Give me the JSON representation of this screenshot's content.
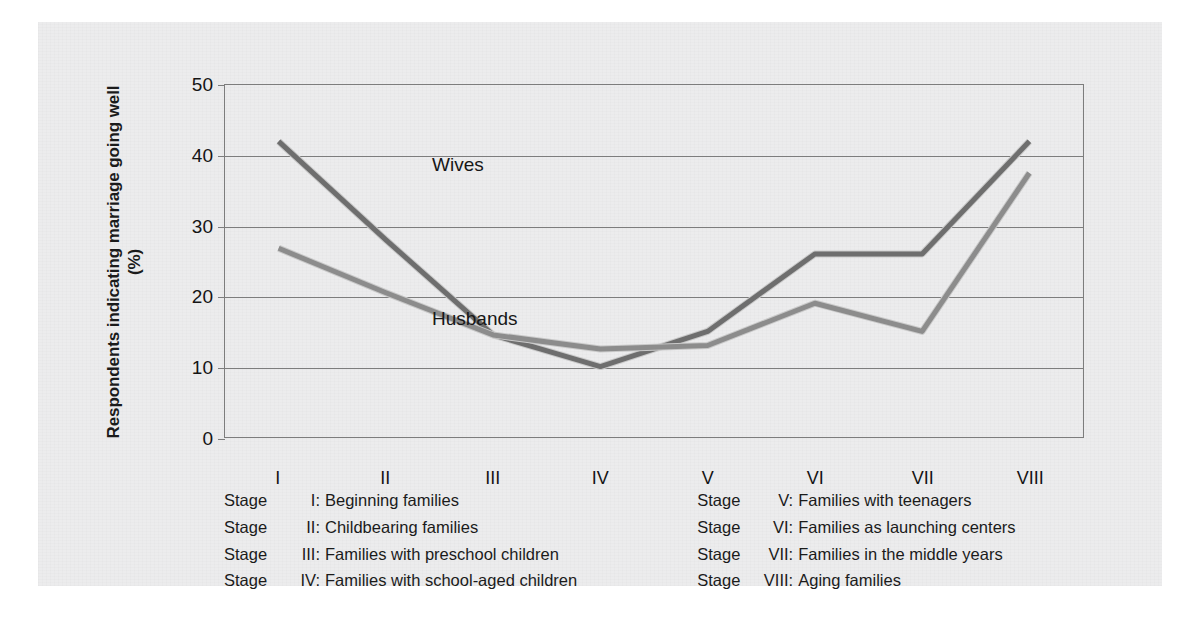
{
  "chart_data": {
    "type": "line",
    "title": "",
    "xlabel": "",
    "ylabel": "Respondents indicating marriage going well (%)",
    "ylim": [
      0,
      50
    ],
    "yticks": [
      0,
      10,
      20,
      30,
      40,
      50
    ],
    "grid": true,
    "legend_position": "inline-annotations",
    "categories": [
      "I",
      "II",
      "III",
      "IV",
      "V",
      "VI",
      "VII",
      "VIII"
    ],
    "series": [
      {
        "name": "Wives",
        "values": [
          42,
          28,
          14.5,
          10,
          15,
          26,
          26,
          42
        ],
        "color": "#6e6e6e"
      },
      {
        "name": "Husbands",
        "values": [
          26.8,
          20.5,
          14.5,
          12.5,
          13,
          19,
          15,
          37.5
        ],
        "color": "#8c8c8c"
      }
    ],
    "annotations": [
      {
        "text": "Wives",
        "series": "Wives"
      },
      {
        "text": "Husbands",
        "series": "Husbands"
      }
    ]
  },
  "axis": {
    "y_tick_labels": [
      "50",
      "40",
      "30",
      "20",
      "10",
      "0"
    ],
    "x_tick_labels": [
      "I",
      "II",
      "III",
      "IV",
      "V",
      "VI",
      "VII",
      "VIII"
    ],
    "y_axis_title": "Respondents indicating marriage going well (%)"
  },
  "annotations": {
    "wives": "Wives",
    "husbands": "Husbands"
  },
  "legend": {
    "stage_word": "Stage",
    "left_column": [
      {
        "stage": "Stage",
        "roman": "I:",
        "description": "Beginning families"
      },
      {
        "stage": "Stage",
        "roman": "II:",
        "description": "Childbearing families"
      },
      {
        "stage": "Stage",
        "roman": "III:",
        "description": "Families with preschool children"
      },
      {
        "stage": "Stage",
        "roman": "IV:",
        "description": "Families with school-aged children"
      }
    ],
    "right_column": [
      {
        "stage": "Stage",
        "roman": "V:",
        "description": "Families with teenagers"
      },
      {
        "stage": "Stage",
        "roman": "VI:",
        "description": "Families as launching centers"
      },
      {
        "stage": "Stage",
        "roman": "VII:",
        "description": "Families in the middle years"
      },
      {
        "stage": "Stage",
        "roman": "VIII:",
        "description": "Aging families"
      }
    ]
  },
  "colors": {
    "panel_background": "#ececed",
    "page_background": "#ffffff",
    "axis": "#7d7d7d",
    "wives_line": "#6e6e6e",
    "husbands_line": "#8c8c8c",
    "text": "#1b1b1b"
  }
}
